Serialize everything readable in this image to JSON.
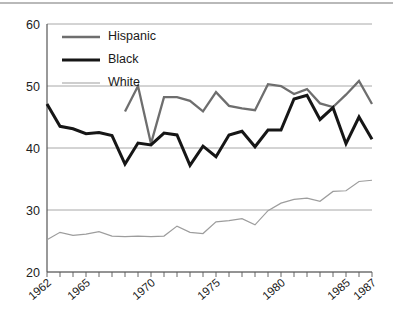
{
  "chart_data": {
    "type": "line",
    "title": "",
    "xlabel": "",
    "ylabel": "",
    "xlim": [
      1962,
      1987
    ],
    "ylim": [
      20,
      60
    ],
    "yticks": [
      20,
      30,
      40,
      50,
      60
    ],
    "grid": true,
    "legend_position": "top-left",
    "x": [
      1962,
      1963,
      1964,
      1965,
      1966,
      1967,
      1968,
      1969,
      1970,
      1971,
      1972,
      1973,
      1974,
      1975,
      1976,
      1977,
      1978,
      1979,
      1980,
      1981,
      1982,
      1983,
      1984,
      1985,
      1986,
      1987
    ],
    "xtick_labels": [
      "1962",
      "1965",
      "1970",
      "1975",
      "1980",
      "1985",
      "1987"
    ],
    "xtick_values": [
      1962,
      1965,
      1970,
      1975,
      1980,
      1985,
      1987
    ],
    "series": [
      {
        "name": "Hispanic",
        "color": "#6e6e6e",
        "width": 2.3,
        "x": [
          1968,
          1969,
          1970,
          1971,
          1972,
          1973,
          1974,
          1975,
          1976,
          1977,
          1978,
          1979,
          1980,
          1981,
          1982,
          1983,
          1984,
          1985,
          1986,
          1987
        ],
        "values": [
          45.9,
          50.0,
          40.7,
          48.2,
          48.2,
          47.6,
          45.9,
          49.0,
          46.8,
          46.4,
          46.1,
          50.3,
          50.0,
          48.7,
          49.5,
          47.2,
          46.6,
          48.6,
          50.8,
          47.1
        ]
      },
      {
        "name": "Black",
        "color": "#161616",
        "width": 3.0,
        "x": [
          1962,
          1963,
          1964,
          1965,
          1966,
          1967,
          1968,
          1969,
          1970,
          1971,
          1972,
          1973,
          1974,
          1975,
          1976,
          1977,
          1978,
          1979,
          1980,
          1981,
          1982,
          1983,
          1984,
          1985,
          1986,
          1987
        ],
        "values": [
          47.1,
          43.5,
          43.1,
          42.3,
          42.5,
          42.0,
          37.4,
          40.8,
          40.5,
          42.4,
          42.1,
          37.2,
          40.3,
          38.6,
          42.1,
          42.7,
          40.2,
          42.9,
          42.9,
          47.9,
          48.5,
          44.6,
          46.5,
          40.7,
          45.0,
          41.4
        ]
      },
      {
        "name": "White",
        "color": "#9d9d9d",
        "width": 1.2,
        "x": [
          1962,
          1963,
          1964,
          1965,
          1966,
          1967,
          1968,
          1969,
          1970,
          1971,
          1972,
          1973,
          1974,
          1975,
          1976,
          1977,
          1978,
          1979,
          1980,
          1981,
          1982,
          1983,
          1984,
          1985,
          1986,
          1987
        ],
        "values": [
          25.2,
          26.4,
          25.9,
          26.1,
          26.5,
          25.8,
          25.7,
          25.8,
          25.7,
          25.8,
          27.4,
          26.4,
          26.2,
          28.1,
          28.3,
          28.6,
          27.6,
          29.9,
          31.1,
          31.7,
          31.9,
          31.4,
          33.0,
          33.1,
          34.6,
          34.8
        ]
      }
    ]
  },
  "legend": {
    "entries": [
      {
        "label": "Hispanic"
      },
      {
        "label": "Black"
      },
      {
        "label": "White"
      }
    ]
  }
}
